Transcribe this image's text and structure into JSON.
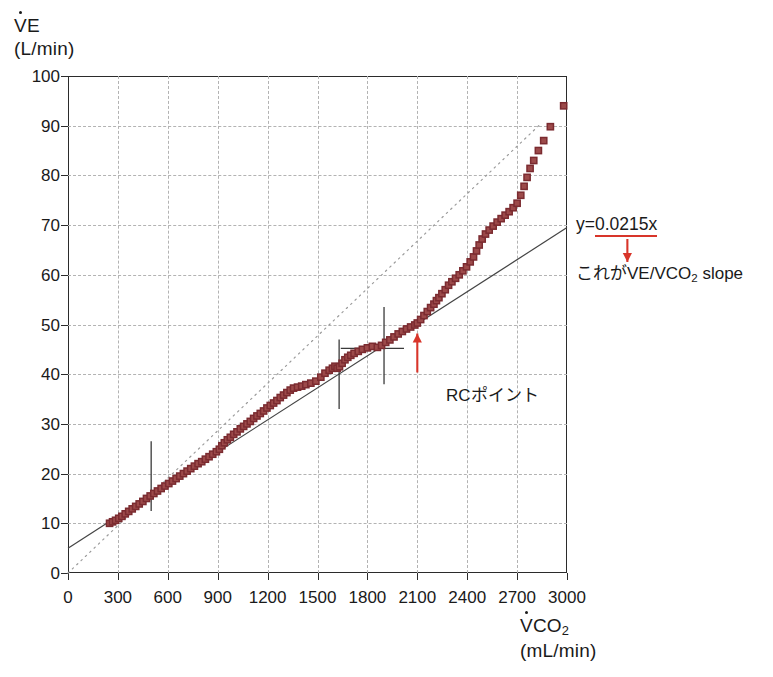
{
  "chart_data": {
    "type": "scatter",
    "title": "",
    "ylabel": "V̇E (L/min)",
    "xlabel": "V̇CO2 (mL/min)",
    "xlim": [
      0,
      3000
    ],
    "ylim": [
      0,
      100
    ],
    "xticks": [
      0,
      300,
      600,
      900,
      1200,
      1500,
      1800,
      2100,
      2400,
      2700,
      3000
    ],
    "yticks": [
      0,
      10,
      20,
      30,
      40,
      50,
      60,
      70,
      80,
      90,
      100
    ],
    "grid": true,
    "legend": "none",
    "series": [
      {
        "name": "VE vs VCO2",
        "marker": "square",
        "color": "#7b2b30",
        "points": [
          [
            250,
            10.0
          ],
          [
            268,
            10.3
          ],
          [
            286,
            10.6
          ],
          [
            305,
            11.0
          ],
          [
            324,
            11.4
          ],
          [
            344,
            11.9
          ],
          [
            365,
            12.4
          ],
          [
            386,
            12.9
          ],
          [
            407,
            13.4
          ],
          [
            428,
            13.9
          ],
          [
            450,
            14.4
          ],
          [
            472,
            15.0
          ],
          [
            494,
            15.5
          ],
          [
            516,
            16.0
          ],
          [
            538,
            16.5
          ],
          [
            560,
            17.0
          ],
          [
            583,
            17.5
          ],
          [
            606,
            18.0
          ],
          [
            628,
            18.5
          ],
          [
            650,
            19.0
          ],
          [
            672,
            19.5
          ],
          [
            694,
            20.0
          ],
          [
            716,
            20.5
          ],
          [
            738,
            21.0
          ],
          [
            760,
            21.5
          ],
          [
            782,
            22.0
          ],
          [
            804,
            22.4
          ],
          [
            826,
            22.9
          ],
          [
            848,
            23.4
          ],
          [
            870,
            23.9
          ],
          [
            892,
            24.4
          ],
          [
            910,
            24.9
          ],
          [
            925,
            25.6
          ],
          [
            940,
            26.2
          ],
          [
            958,
            26.8
          ],
          [
            976,
            27.3
          ],
          [
            996,
            27.9
          ],
          [
            1016,
            28.4
          ],
          [
            1036,
            29.0
          ],
          [
            1056,
            29.5
          ],
          [
            1076,
            30.0
          ],
          [
            1096,
            30.5
          ],
          [
            1116,
            31.1
          ],
          [
            1136,
            31.6
          ],
          [
            1156,
            32.1
          ],
          [
            1176,
            32.6
          ],
          [
            1196,
            33.2
          ],
          [
            1216,
            33.7
          ],
          [
            1236,
            34.2
          ],
          [
            1256,
            34.7
          ],
          [
            1276,
            35.3
          ],
          [
            1296,
            35.8
          ],
          [
            1316,
            36.3
          ],
          [
            1336,
            36.8
          ],
          [
            1356,
            37.2
          ],
          [
            1380,
            37.4
          ],
          [
            1405,
            37.6
          ],
          [
            1430,
            37.9
          ],
          [
            1460,
            38.2
          ],
          [
            1490,
            38.6
          ],
          [
            1520,
            39.4
          ],
          [
            1545,
            40.2
          ],
          [
            1570,
            40.8
          ],
          [
            1590,
            41.2
          ],
          [
            1605,
            41.6
          ],
          [
            1618,
            41.2
          ],
          [
            1632,
            41.5
          ],
          [
            1648,
            42.2
          ],
          [
            1665,
            42.9
          ],
          [
            1682,
            43.4
          ],
          [
            1700,
            43.8
          ],
          [
            1720,
            44.2
          ],
          [
            1745,
            44.6
          ],
          [
            1770,
            45.0
          ],
          [
            1800,
            45.3
          ],
          [
            1830,
            45.6
          ],
          [
            1860,
            45.4
          ],
          [
            1885,
            45.8
          ],
          [
            1910,
            46.4
          ],
          [
            1935,
            46.9
          ],
          [
            1960,
            47.5
          ],
          [
            1985,
            48.1
          ],
          [
            2010,
            48.6
          ],
          [
            2035,
            49.1
          ],
          [
            2060,
            49.5
          ],
          [
            2085,
            49.9
          ],
          [
            2100,
            50.3
          ],
          [
            2120,
            51.0
          ],
          [
            2140,
            51.8
          ],
          [
            2160,
            52.6
          ],
          [
            2180,
            53.4
          ],
          [
            2200,
            54.1
          ],
          [
            2215,
            54.8
          ],
          [
            2230,
            55.4
          ],
          [
            2248,
            56.2
          ],
          [
            2268,
            57.0
          ],
          [
            2288,
            57.9
          ],
          [
            2308,
            58.6
          ],
          [
            2330,
            59.3
          ],
          [
            2352,
            60.0
          ],
          [
            2374,
            60.8
          ],
          [
            2396,
            61.6
          ],
          [
            2418,
            62.6
          ],
          [
            2438,
            63.6
          ],
          [
            2456,
            64.8
          ],
          [
            2472,
            66.0
          ],
          [
            2490,
            67.2
          ],
          [
            2510,
            68.2
          ],
          [
            2532,
            69.0
          ],
          [
            2556,
            69.8
          ],
          [
            2580,
            70.6
          ],
          [
            2604,
            71.3
          ],
          [
            2628,
            72.0
          ],
          [
            2652,
            72.7
          ],
          [
            2676,
            73.5
          ],
          [
            2700,
            74.4
          ],
          [
            2722,
            76.0
          ],
          [
            2742,
            77.8
          ],
          [
            2760,
            79.6
          ],
          [
            2778,
            81.4
          ],
          [
            2800,
            83.0
          ],
          [
            2828,
            85.0
          ],
          [
            2860,
            87.0
          ],
          [
            2900,
            89.8
          ],
          [
            2980,
            94.0
          ]
        ]
      }
    ],
    "fit_line": {
      "label": "y=0.0215x",
      "slope": 0.0215,
      "intercept": 5.0,
      "x_start": 0,
      "x_end": 3000,
      "style": "solid",
      "color": "#444444"
    },
    "reference_line": {
      "label": "",
      "x_start": 0,
      "y_start": 0,
      "x_end": 2830,
      "y_end": 90,
      "style": "dotted",
      "color": "#9b9b9b"
    },
    "markers": {
      "vertical_bars": [
        {
          "x": 500,
          "y_low": 12.5,
          "y_high": 26.5
        },
        {
          "x": 1630,
          "y_low": 33.0,
          "y_high": 47.0
        },
        {
          "x": 1900,
          "y_low": 38.0,
          "y_high": 53.5
        }
      ],
      "horizontal_bar": {
        "y": 45.2,
        "x_left": 1640,
        "x_right": 2020
      }
    },
    "annotations": [
      {
        "name": "rc-point",
        "text": "RCポイント",
        "point_x": 2100,
        "point_y": 50,
        "arrow_color": "#d8352a"
      },
      {
        "name": "equation",
        "text": "y=0.0215x",
        "underline": true,
        "underline_color": "#d8352a"
      },
      {
        "name": "slope-note",
        "text": "これがVE/VCO2 slope",
        "arrow_color": "#d8352a"
      }
    ]
  },
  "axes": {
    "y_title_line1": "V̇E",
    "y_title_line2": "(L/min)",
    "x_title_line1": "V̇CO",
    "x_title_sub": "2",
    "x_title_line2": "(mL/min)",
    "y_tick_labels": [
      "100",
      "90",
      "80",
      "70",
      "60",
      "50",
      "40",
      "30",
      "20",
      "10",
      "0"
    ],
    "x_tick_labels": [
      "0",
      "300",
      "600",
      "900",
      "1200",
      "1500",
      "1800",
      "2100",
      "2400",
      "2700",
      "3000"
    ]
  },
  "annotations": {
    "equation_prefix": "y=",
    "equation_value": "0.0215x",
    "slope_note_jp": "これが",
    "slope_note_en_a": "VE/VCO",
    "slope_note_sub": "2",
    "slope_note_en_b": " slope",
    "rc_label": "RCポイント"
  },
  "colors": {
    "marker": "#7b2b30",
    "marker_fill": "#9c4a4a",
    "accent_red": "#d8352a",
    "axis": "#2b2b2b",
    "grid": "#b3b3b3",
    "fit_line": "#444444",
    "ref_line": "#9b9b9b"
  }
}
